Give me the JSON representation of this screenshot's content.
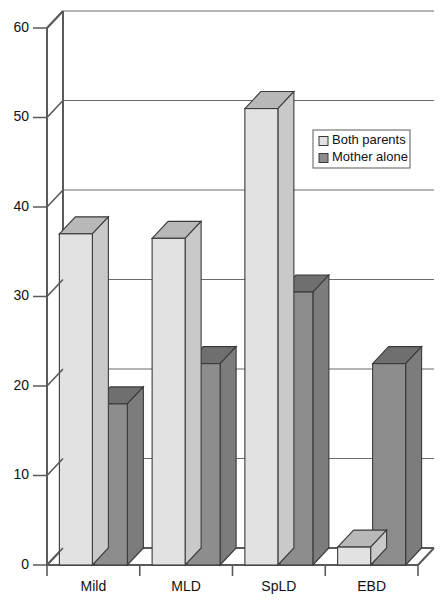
{
  "chart_data": {
    "type": "bar",
    "title": "",
    "xlabel": "",
    "ylabel": "",
    "categories": [
      "Mild",
      "MLD",
      "SpLD",
      "EBD"
    ],
    "series": [
      {
        "name": "Both parents",
        "values": [
          37,
          36.5,
          51,
          2
        ]
      },
      {
        "name": "Mother alone",
        "values": [
          18,
          22.5,
          30.5,
          22.5
        ]
      }
    ],
    "ylim": [
      0,
      60
    ],
    "yticks": [
      0,
      10,
      20,
      30,
      40,
      50,
      60
    ],
    "ytick_labels": [
      "0",
      "10",
      "20",
      "30",
      "40",
      "50",
      "60"
    ],
    "grid": true,
    "legend_position": "upper right",
    "style": "3d-bar"
  },
  "legend": {
    "items": [
      {
        "label": "Both parents",
        "swatch": "light-gray-square"
      },
      {
        "label": "Mother alone",
        "swatch": "dark-gray-square"
      }
    ]
  },
  "colors": {
    "series_light_front": "#e2e2e2",
    "series_light_top": "#b8b8b8",
    "series_light_side": "#c9c9c9",
    "series_dark_front": "#8d8d8d",
    "series_dark_top": "#6f6f6f",
    "series_dark_side": "#7c7c7c",
    "outline": "#3a3a3a",
    "axis": "#5a5a5a",
    "grid": "#6a6a6a",
    "background": "#ffffff"
  }
}
